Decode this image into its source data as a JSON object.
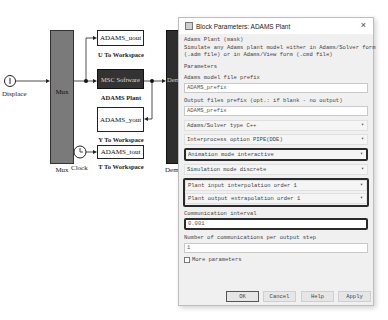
{
  "diagram": {
    "displace_label": "Displace",
    "mux_inner": "Mux",
    "mux_label": "Mux",
    "u_block": "ADAMS_uout",
    "u_label": "U To Workspace",
    "plant_block": "MSC Software",
    "plant_label": "ADAMS Plant",
    "y_block": "ADAMS_yout",
    "y_label": "Y To Workspace",
    "t_block": "ADAMS_tout",
    "t_label": "T To Workspace",
    "clock_label": "Clock",
    "demux_inner": "Dem",
    "demux_label": "Dem"
  },
  "dialog": {
    "title": "Block Parameters: ADAMS Plant",
    "close": "×",
    "mask_name": "Adams Plant (mask)",
    "description_line1": "Simulate any Adams plant model either in Adams/Solver form",
    "description_line2": "(.adm file) or in Adams/View form (.cmd file)",
    "parameters_heading": "Parameters",
    "model_prefix_label": "Adams model file prefix",
    "model_prefix_value": "ADAMS_prefix",
    "output_prefix_label": "Output files prefix (opt.: if blank - no output)",
    "output_prefix_value": "ADAMS_prefix",
    "solver_type": "Adams/Solver type  C++",
    "interprocess": "Interprocess option  PIPE(DDE)",
    "animation_mode": "Animation mode  interactive",
    "simulation_mode": "Simulation mode  discrete",
    "input_interp": "Plant input interpolation order  1",
    "output_extrap": "Plant output extrapolation order  1",
    "comm_interval_label": "Communication interval",
    "comm_interval_value": "0.001",
    "num_comm_label": "Number of communications per output step",
    "num_comm_value": "1",
    "more_params": "More parameters",
    "caret": "▾",
    "buttons": {
      "ok": "OK",
      "cancel": "Cancel",
      "help": "Help",
      "apply": "Apply"
    }
  }
}
